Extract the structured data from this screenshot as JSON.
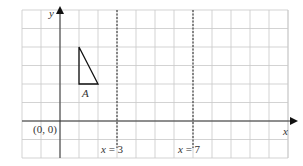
{
  "diagram": {
    "type": "coordinate-grid",
    "grid": {
      "x_min": -2,
      "x_max": 12,
      "y_min": -2,
      "y_max": 6,
      "origin_px": [
        60,
        121
      ],
      "cell_w": 19,
      "cell_h": 18.5,
      "left_px": 22,
      "right_px": 288,
      "top_px": 10,
      "bottom_px": 158,
      "color": "#c8c8c8"
    },
    "axes": {
      "x_label": "x",
      "y_label": "y",
      "origin_label": "(0, 0)",
      "color": "#333333"
    },
    "lines": [
      {
        "label": "x = 3",
        "x": 3,
        "style": "dashed"
      },
      {
        "label": "x = 7",
        "x": 7,
        "style": "dashed"
      }
    ],
    "shapes": [
      {
        "label": "A",
        "type": "triangle",
        "vertices": [
          [
            1,
            4
          ],
          [
            1,
            2
          ],
          [
            2,
            2
          ]
        ]
      }
    ]
  }
}
